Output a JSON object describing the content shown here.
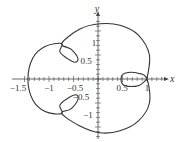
{
  "chart_data": {
    "type": "line",
    "title": "",
    "xlabel": "x",
    "ylabel": "y",
    "xlim": [
      -1.55,
      1.45
    ],
    "ylim": [
      -1.3,
      1.45
    ],
    "grid": false,
    "x_ticks": [
      "-1.5",
      "-1",
      "-0.5",
      "0.5",
      "1"
    ],
    "y_ticks": [
      "1",
      "0.5",
      "-0.5",
      "-1"
    ],
    "series": [
      {
        "name": "closed curve with three inner loops",
        "description": "Closed curve: outer boundary reaching x=-1.5 on left, top near y=1.15, bottom near y=-1.15, crossing x-axis at x=1 on right; small loops near (-0.75,0.6), (-0.75,-0.6) and between x=0.5 and x=1 on the x-axis",
        "points_xy": [
          [
            1.0,
            0.0
          ],
          [
            1.05,
            0.5
          ],
          [
            0.82,
            0.92
          ],
          [
            0.45,
            1.12
          ],
          [
            0.04,
            1.15
          ],
          [
            -0.37,
            1.04
          ],
          [
            -0.74,
            0.74
          ],
          [
            -0.55,
            0.62
          ],
          [
            -0.41,
            0.43
          ],
          [
            -0.47,
            0.35
          ],
          [
            -0.63,
            0.43
          ],
          [
            -0.78,
            0.57
          ],
          [
            -0.74,
            0.74
          ],
          [
            -1.08,
            0.68
          ],
          [
            -1.33,
            0.44
          ],
          [
            -1.43,
            0.0
          ],
          [
            -1.33,
            -0.44
          ],
          [
            -1.08,
            -0.68
          ],
          [
            -0.74,
            -0.72
          ],
          [
            -0.78,
            -0.55
          ],
          [
            -0.63,
            -0.41
          ],
          [
            -0.45,
            -0.33
          ],
          [
            -0.41,
            -0.43
          ],
          [
            -0.55,
            -0.62
          ],
          [
            -0.74,
            -0.72
          ],
          [
            -0.37,
            -0.98
          ],
          [
            0.04,
            -1.12
          ],
          [
            0.45,
            -1.08
          ],
          [
            0.82,
            -0.88
          ],
          [
            1.05,
            -0.5
          ],
          [
            1.0,
            0.0
          ],
          [
            0.82,
            0.12
          ],
          [
            0.55,
            0.12
          ],
          [
            0.47,
            0.0
          ],
          [
            0.55,
            -0.14
          ],
          [
            0.82,
            -0.14
          ],
          [
            1.0,
            0.0
          ]
        ]
      }
    ]
  },
  "axes": {
    "x_label": "x",
    "y_label": "y",
    "x_tick_labels": [
      {
        "text": "−1.5",
        "x": 18,
        "y": 91
      },
      {
        "text": "−1",
        "x": 49,
        "y": 91
      },
      {
        "text": "−0.5",
        "x": 75,
        "y": 91
      },
      {
        "text": "0.5",
        "x": 122,
        "y": 91
      },
      {
        "text": "1",
        "x": 147,
        "y": 91
      }
    ],
    "y_tick_labels": [
      {
        "text": "1",
        "x": 94,
        "y": 46
      },
      {
        "text": "0.5",
        "x": 86,
        "y": 64
      },
      {
        "text": "−0.5",
        "x": 81,
        "y": 100
      },
      {
        "text": "−1",
        "x": 88,
        "y": 118
      }
    ]
  },
  "style": {
    "curve_color": "#333333",
    "axis_color": "#444444"
  }
}
